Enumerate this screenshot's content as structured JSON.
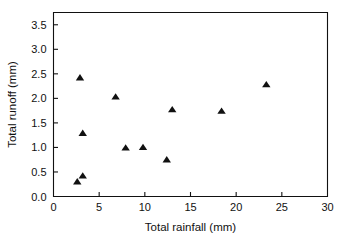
{
  "chart_data": {
    "type": "scatter",
    "title": "",
    "xlabel": "Total rainfall (mm)",
    "ylabel": "Total runoff (mm)",
    "xlim": [
      0,
      30
    ],
    "ylim": [
      0.0,
      3.75
    ],
    "xticks": [
      "0",
      "5",
      "10",
      "15",
      "20",
      "25",
      "30"
    ],
    "xtick_values": [
      0,
      5,
      10,
      15,
      20,
      25,
      30
    ],
    "yticks": [
      "0.0",
      "0.5",
      "1.0",
      "1.5",
      "2.0",
      "2.5",
      "3.0",
      "3.5"
    ],
    "ytick_values": [
      0.0,
      0.5,
      1.0,
      1.5,
      2.0,
      2.5,
      3.0,
      3.5
    ],
    "grid": false,
    "legend": null,
    "marker_style": "triangle-up",
    "marker_color": "#111111",
    "points": [
      {
        "x": 2.6,
        "y": 0.3
      },
      {
        "x": 3.2,
        "y": 0.42
      },
      {
        "x": 3.2,
        "y": 1.29
      },
      {
        "x": 2.9,
        "y": 2.42
      },
      {
        "x": 6.8,
        "y": 2.03
      },
      {
        "x": 7.9,
        "y": 0.99
      },
      {
        "x": 9.8,
        "y": 1.0
      },
      {
        "x": 12.4,
        "y": 0.75
      },
      {
        "x": 13.0,
        "y": 1.77
      },
      {
        "x": 18.4,
        "y": 1.74
      },
      {
        "x": 23.3,
        "y": 2.28
      }
    ]
  }
}
